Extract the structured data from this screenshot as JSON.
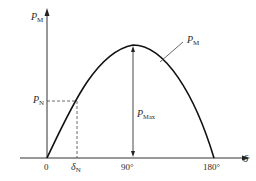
{
  "diagram": {
    "type": "power-angle characteristic",
    "y_axis": {
      "symbol": "P",
      "subscript": "M"
    },
    "x_axis": {
      "symbol": "δ"
    },
    "curve_label": {
      "symbol": "P",
      "subscript": "M"
    },
    "max_label": {
      "symbol": "P",
      "subscript": "Max"
    },
    "rated_power_label": {
      "symbol": "P",
      "subscript": "N"
    },
    "rated_angle_label": {
      "symbol": "δ",
      "subscript": "N"
    },
    "x_ticks": [
      {
        "label": "0"
      },
      {
        "label": "90°"
      },
      {
        "label": "180°"
      }
    ],
    "colors": {
      "line": "#1a1a1a",
      "text": "#2a2a2a",
      "background": "#ffffff"
    }
  }
}
